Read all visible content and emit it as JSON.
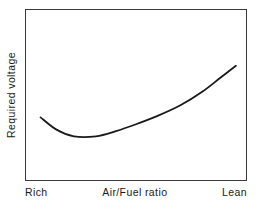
{
  "figure": {
    "width": 259,
    "height": 209,
    "background_color": "#ffffff",
    "frame_color": "#3a3a3a",
    "curve_color": "#1a1a1a"
  },
  "axes": {
    "ylabel": "Required voltage",
    "x_left_label": "Rich",
    "x_center_label": "Air/Fuel ratio",
    "x_right_label": "Lean"
  },
  "chart_data": {
    "type": "line",
    "title": "",
    "subtitle": "",
    "xlabel": "Air/Fuel ratio",
    "ylabel": "Required voltage",
    "xlim": [
      0,
      1
    ],
    "ylim": [
      0,
      1
    ],
    "grid": false,
    "legend": "none",
    "axis_ticks": "none",
    "annotations": [
      "Rich",
      "Air/Fuel ratio",
      "Lean"
    ],
    "xtick_labels": [
      "Rich",
      "Lean"
    ],
    "ytick_labels": [],
    "series": [
      {
        "name": "Required voltage",
        "color": "#1a1a1a",
        "line_width": 1.8,
        "x": [
          0.07,
          0.14,
          0.22,
          0.32,
          0.41,
          0.5,
          0.6,
          0.7,
          0.8,
          0.88,
          0.95
        ],
        "y": [
          0.37,
          0.3,
          0.26,
          0.26,
          0.29,
          0.33,
          0.38,
          0.44,
          0.52,
          0.6,
          0.67
        ]
      }
    ],
    "minimum_point": {
      "x": 0.27,
      "y": 0.26
    },
    "start_point": {
      "x": 0.07,
      "y": 0.37
    },
    "end_point": {
      "x": 0.95,
      "y": 0.67
    }
  }
}
